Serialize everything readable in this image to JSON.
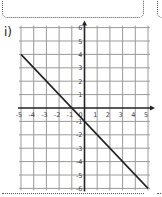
{
  "problem_label": "i)",
  "chart_data": {
    "type": "line",
    "title": "",
    "xlabel": "",
    "ylabel": "",
    "xlim": [
      -5,
      5
    ],
    "ylim": [
      -6,
      6
    ],
    "grid": true,
    "x_ticks": [
      "-5",
      "-4",
      "-3",
      "-2",
      "-1",
      "0",
      "1",
      "2",
      "3",
      "4",
      "5"
    ],
    "y_ticks": [
      "6",
      "5",
      "4",
      "3",
      "2",
      "1",
      "-1",
      "-2",
      "-3",
      "-4",
      "-5",
      "-6"
    ],
    "series": [
      {
        "name": "y = -x - 1",
        "x": [
          -5,
          5
        ],
        "y": [
          4,
          -6
        ]
      }
    ]
  },
  "colors": {
    "grid": "#9a9a9a",
    "axis": "#222222",
    "line": "#222222",
    "border": "#555555"
  }
}
